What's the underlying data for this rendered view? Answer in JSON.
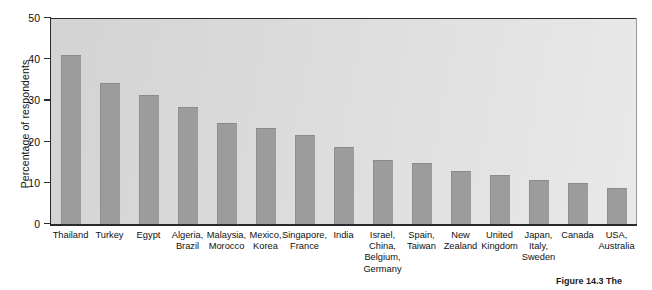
{
  "chart_data": {
    "type": "bar",
    "title": "",
    "xlabel": "",
    "ylabel": "Percentage of respondents",
    "ylim": [
      0,
      50
    ],
    "yticks": [
      0,
      10,
      20,
      30,
      40,
      50
    ],
    "grid": false,
    "legend": null,
    "orientation": "vertical",
    "bar_color": "#9c9c9c",
    "plot_background": "#dcdcdc",
    "categories": [
      "Thailand",
      "Turkey",
      "Egypt",
      "Algeria,\nBrazil",
      "Malaysia,\nMorocco",
      "Mexico,\nKorea",
      "Singapore,\nFrance",
      "India",
      "Israel,\nChina,\nBelgium,\nGermany",
      "Spain,\nTaiwan",
      "New\nZealand",
      "United\nKingdom",
      "Japan,\nItaly,\nSweden",
      "Canada",
      "USA,\nAustralia"
    ],
    "values": [
      41.0,
      34.2,
      31.2,
      28.3,
      24.5,
      23.4,
      21.6,
      18.6,
      15.6,
      14.8,
      12.8,
      11.8,
      10.8,
      10.0,
      8.8
    ]
  },
  "caption": {
    "text": "Figure 14.3 The"
  }
}
